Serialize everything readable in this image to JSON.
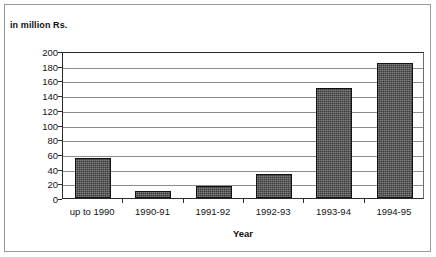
{
  "figure": {
    "width": 436,
    "height": 257,
    "background_color": "#ffffff",
    "frame_color": "#9a9a9a"
  },
  "chart_data": {
    "type": "bar",
    "title": "in million Rs.",
    "subtitle": "",
    "xlabel": "Year",
    "ylabel": "",
    "categories": [
      "up to 1990",
      "1990-91",
      "1991-92",
      "1992-93",
      "1993-94",
      "1994-95"
    ],
    "values": [
      54,
      10,
      17,
      32,
      150,
      184
    ],
    "ylim": [
      0,
      200
    ],
    "ytick_step": 20,
    "yticks": [
      0,
      20,
      40,
      60,
      80,
      100,
      120,
      140,
      160,
      180,
      200
    ],
    "ytick_labels": [
      "0",
      "20",
      "40",
      "60",
      "80",
      "100",
      "120",
      "140",
      "160",
      "180",
      "200"
    ],
    "grid": true,
    "grid_axis": "y",
    "grid_color": "#8d8d8d",
    "legend": false,
    "legend_position": "none",
    "bar_fill_color": "#4c4c4c",
    "bar_edge_color": "#111111",
    "axis_color": "#2b2b2b"
  }
}
